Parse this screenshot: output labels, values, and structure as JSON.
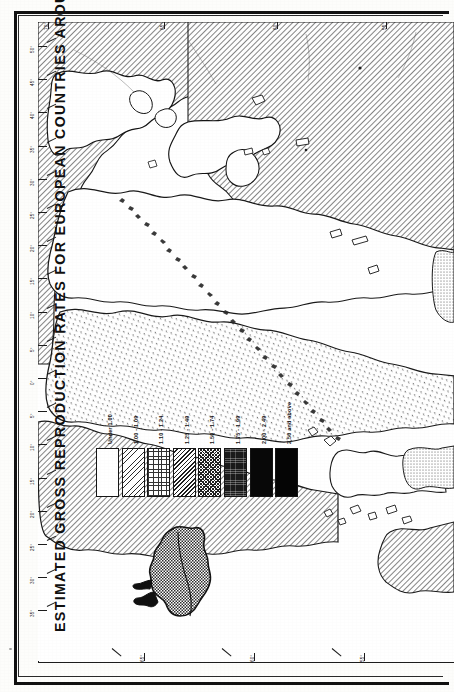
{
  "document": {
    "title": "ESTIMATED GROSS REPRODUCTION RATES FOR EUROPEAN COUNTRIES AROUND 1950-55",
    "orientation": "rotated-90-ccw",
    "media": "scanned printed map page"
  },
  "legend": {
    "name": "Gross reproduction rate classes",
    "classes": [
      {
        "label": "Under 1.00",
        "pattern": "blank",
        "swatch_class": "p0"
      },
      {
        "label": "1.00 - 1.09",
        "pattern": "sparse-diagonal-dots",
        "swatch_class": "p1"
      },
      {
        "label": "1.10 - 1.24",
        "pattern": "fine-stipple-grid",
        "swatch_class": "p2"
      },
      {
        "label": "1.25 - 1.49",
        "pattern": "diagonal-hatch",
        "swatch_class": "p3"
      },
      {
        "label": "1.50 - 1.74",
        "pattern": "cross-hatch",
        "swatch_class": "p4"
      },
      {
        "label": "1.75 - 1.99",
        "pattern": "dense-dark-texture",
        "swatch_class": "p5"
      },
      {
        "label": "2.00 - 2.49",
        "pattern": "near-solid-grid",
        "swatch_class": "p6"
      },
      {
        "label": "2.50 and above",
        "pattern": "solid-black",
        "swatch_class": "p7"
      }
    ]
  },
  "graticule": {
    "left_edge_labels": [
      "50°",
      "45°",
      "40°",
      "35°",
      "30°",
      "25°",
      "20°",
      "15°",
      "10°",
      "5°",
      "0°",
      "5°",
      "10°",
      "15°",
      "20°",
      "25°",
      "30°",
      "35°"
    ],
    "top_edge_labels": [
      "70°",
      "65°",
      "60°",
      "55°"
    ],
    "bottom_edge_labels": [
      "65°",
      "60°",
      "55°"
    ]
  },
  "chart_data": {
    "type": "map",
    "title": "ESTIMATED GROSS REPRODUCTION RATES FOR EUROPEAN COUNTRIES AROUND 1950-55",
    "variable": "Gross reproduction rate",
    "period": "around 1950-55",
    "region": "Europe",
    "class_breaks": [
      {
        "label": "Under 1.00",
        "min": null,
        "max": 1.0
      },
      {
        "label": "1.00 - 1.09",
        "min": 1.0,
        "max": 1.09
      },
      {
        "label": "1.10 - 1.24",
        "min": 1.1,
        "max": 1.24
      },
      {
        "label": "1.25 - 1.49",
        "min": 1.25,
        "max": 1.49
      },
      {
        "label": "1.50 - 1.74",
        "min": 1.5,
        "max": 1.74
      },
      {
        "label": "1.75 - 1.99",
        "min": 1.75,
        "max": 1.99
      },
      {
        "label": "2.00 - 2.49",
        "min": 2.0,
        "max": 2.49
      },
      {
        "label": "2.50 and above",
        "min": 2.5,
        "max": null
      }
    ],
    "legend_position": "lower-left of map face",
    "grid": "graticule ticks every 5 degrees"
  }
}
